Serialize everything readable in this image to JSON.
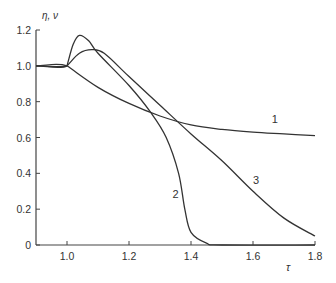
{
  "chart_data": {
    "type": "line",
    "title": "",
    "xlabel": "τ",
    "ylabel": "η, ν",
    "xlim": [
      0.9,
      1.8
    ],
    "ylim": [
      0,
      1.2
    ],
    "grid": false,
    "legend": "inline curve labels",
    "x_ticks": [
      "1.0",
      "1.2",
      "1.4",
      "1.6",
      "1.8"
    ],
    "y_ticks": [
      "0",
      "0.2",
      "0.4",
      "0.6",
      "0.8",
      "1.0",
      "1.2"
    ],
    "series": [
      {
        "name": "1",
        "x": [
          0.9,
          1.0,
          1.1,
          1.2,
          1.3,
          1.4,
          1.5,
          1.6,
          1.7,
          1.8
        ],
        "values": [
          1.0,
          1.0,
          0.88,
          0.79,
          0.72,
          0.67,
          0.645,
          0.63,
          0.62,
          0.61
        ]
      },
      {
        "name": "2",
        "x": [
          0.9,
          1.0,
          1.02,
          1.04,
          1.07,
          1.1,
          1.2,
          1.27,
          1.32,
          1.36,
          1.38,
          1.4,
          1.45,
          1.5,
          1.8
        ],
        "values": [
          1.0,
          1.0,
          1.12,
          1.17,
          1.14,
          1.07,
          0.89,
          0.74,
          0.6,
          0.4,
          0.2,
          0.07,
          0.01,
          0.0,
          0.0
        ]
      },
      {
        "name": "3",
        "x": [
          0.9,
          1.0,
          1.04,
          1.08,
          1.12,
          1.2,
          1.3,
          1.4,
          1.5,
          1.6,
          1.7,
          1.8
        ],
        "values": [
          1.0,
          1.0,
          1.07,
          1.09,
          1.07,
          0.94,
          0.78,
          0.62,
          0.47,
          0.3,
          0.15,
          0.05
        ]
      }
    ],
    "annotations": [
      {
        "text": "1",
        "x": 1.67,
        "y": 0.68
      },
      {
        "text": "2",
        "x": 1.35,
        "y": 0.26
      },
      {
        "text": "3",
        "x": 1.61,
        "y": 0.34
      }
    ]
  }
}
